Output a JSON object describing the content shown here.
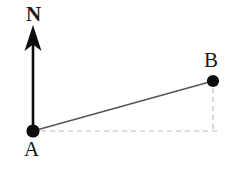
{
  "figure": {
    "type": "bearing-diagram",
    "background_color": "#ffffff",
    "width": 235,
    "height": 172,
    "labels": {
      "north": "N",
      "point_a": "A",
      "point_b": "B"
    },
    "colors": {
      "ink": "#1a1a1a",
      "north_arrow": "#0d0d0d",
      "connector_line": "#555555",
      "dashed_guide": "#bdbdbd",
      "point_marker": "#0d0d0d"
    },
    "points": [
      {
        "name": "A",
        "x": 33,
        "y": 131,
        "radius": 6.5,
        "filled": true
      },
      {
        "name": "B",
        "x": 213,
        "y": 81,
        "radius": 6.0,
        "filled": true
      }
    ],
    "north_arrow": {
      "shaft_x": 33,
      "shaft_top_y": 40,
      "shaft_bottom_y": 131,
      "shaft_width": 2.6,
      "head_tip_y": 25,
      "head_half_width": 8.5,
      "head_base_y": 50,
      "head_notch_y": 44
    },
    "connector": {
      "from": "A",
      "to": "B",
      "style": "solid",
      "width": 1.4
    },
    "guides": [
      {
        "name": "horizontal-guide",
        "style": "dashed",
        "from_x": 40,
        "from_y": 131,
        "to_x": 220,
        "to_y": 131
      },
      {
        "name": "vertical-guide",
        "style": "dashed",
        "from_x": 213,
        "from_y": 88,
        "to_x": 213,
        "to_y": 131
      }
    ]
  }
}
